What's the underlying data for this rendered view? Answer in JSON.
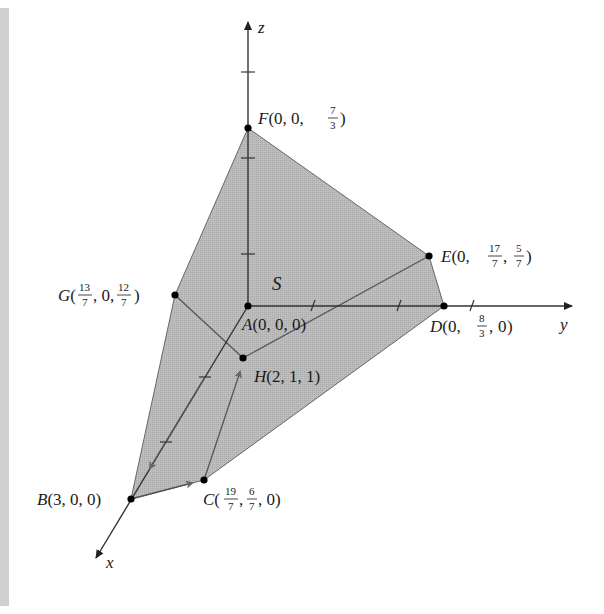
{
  "figure": {
    "region_label": "S",
    "axes": {
      "x": "x",
      "y": "y",
      "z": "z"
    },
    "points": {
      "A": {
        "name": "A",
        "coords": "(0, 0, 0)"
      },
      "B": {
        "name": "B",
        "coords": "(3, 0, 0)"
      },
      "C": {
        "name": "C",
        "coords_parts": [
          "19",
          "7",
          "6",
          "7",
          "0"
        ]
      },
      "D": {
        "name": "D",
        "coords_parts": [
          "0",
          "8",
          "3",
          "0"
        ]
      },
      "E": {
        "name": "E",
        "coords_parts": [
          "0",
          "17",
          "7",
          "5",
          "7"
        ]
      },
      "F": {
        "name": "F",
        "coords_parts": [
          "0",
          "0",
          "7",
          "3"
        ]
      },
      "G": {
        "name": "G",
        "coords_parts": [
          "13",
          "7",
          "0",
          "12",
          "7"
        ]
      },
      "H": {
        "name": "H",
        "coords": "(2, 1, 1)"
      }
    },
    "colors": {
      "region_fill": "#b4b4b4",
      "lines": "#555555",
      "axes": "#333333",
      "points": "#000000"
    }
  }
}
